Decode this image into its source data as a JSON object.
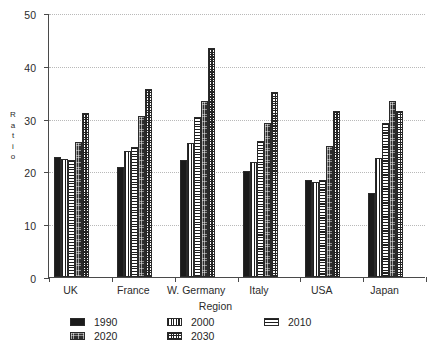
{
  "chart_data": {
    "type": "bar",
    "title": "",
    "xlabel": "Region",
    "ylabel": "Ratio",
    "ylim": [
      0,
      50
    ],
    "yticks": [
      0,
      10,
      20,
      30,
      40,
      50
    ],
    "grid": true,
    "legend_position": "bottom",
    "categories": [
      "UK",
      "France",
      "W. Germany",
      "Italy",
      "USA",
      "Japan"
    ],
    "series": [
      {
        "name": "1990",
        "pattern": "solid-black",
        "values": [
          22.8,
          20.8,
          22.2,
          20.0,
          18.3,
          16.0
        ]
      },
      {
        "name": "2000",
        "pattern": "vertical-lines",
        "values": [
          22.3,
          23.8,
          25.3,
          21.8,
          18.0,
          22.5
        ]
      },
      {
        "name": "2010",
        "pattern": "horizontal-lines",
        "values": [
          22.2,
          24.6,
          30.3,
          25.8,
          18.3,
          29.2
        ]
      },
      {
        "name": "2020",
        "pattern": "dark-speckle",
        "values": [
          25.5,
          30.5,
          33.3,
          29.2,
          24.8,
          33.4
        ]
      },
      {
        "name": "2030",
        "pattern": "fine-grid",
        "values": [
          31.1,
          35.7,
          43.4,
          35.0,
          31.5,
          31.4
        ]
      }
    ]
  },
  "legend": {
    "items": [
      {
        "label": "1990"
      },
      {
        "label": "2000"
      },
      {
        "label": "2010"
      },
      {
        "label": "2020"
      },
      {
        "label": "2030"
      }
    ]
  },
  "axis": {
    "y_title_letters": [
      "R",
      "a",
      "t",
      "i",
      "o"
    ],
    "y_tick_labels": [
      "50",
      "40",
      "30",
      "20",
      "10",
      "0"
    ],
    "x_title": "Region"
  }
}
